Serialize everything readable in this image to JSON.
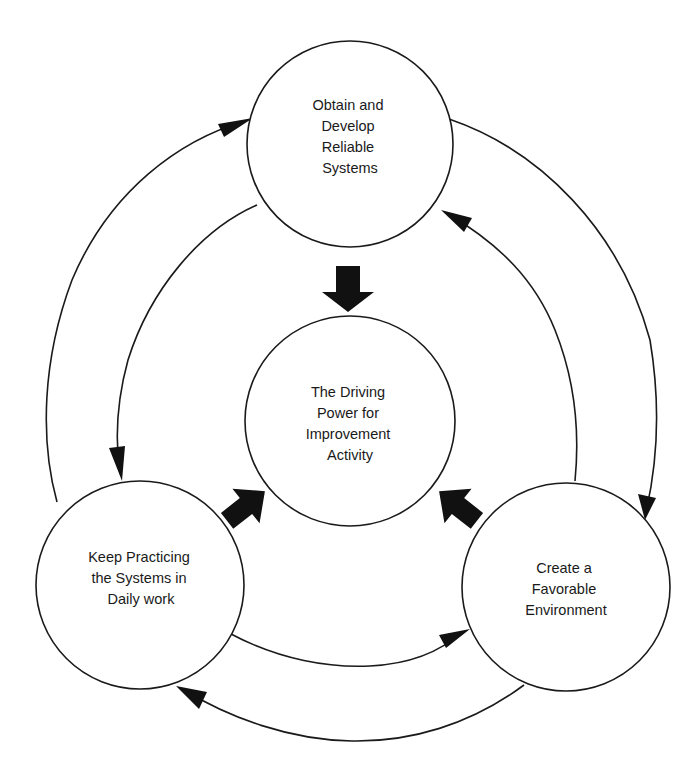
{
  "diagram": {
    "type": "cycle",
    "nodes": [
      {
        "id": "top",
        "lines": [
          "Obtain and",
          "Develop",
          "Reliable",
          "Systems"
        ]
      },
      {
        "id": "center",
        "lines": [
          "The Driving",
          "Power for",
          "Improvement",
          "Activity"
        ]
      },
      {
        "id": "left",
        "lines": [
          "Keep Practicing",
          "the Systems in",
          "Daily work"
        ]
      },
      {
        "id": "right",
        "lines": [
          "Create a",
          "Favorable",
          "Environment"
        ]
      }
    ],
    "edges": [
      {
        "from": "top",
        "to": "center",
        "style": "block-arrow"
      },
      {
        "from": "left",
        "to": "center",
        "style": "block-arrow"
      },
      {
        "from": "right",
        "to": "center",
        "style": "block-arrow"
      },
      {
        "from": "top",
        "to": "right",
        "style": "outer-arc"
      },
      {
        "from": "right",
        "to": "left",
        "style": "outer-arc"
      },
      {
        "from": "left",
        "to": "top",
        "style": "outer-arc"
      },
      {
        "from": "top",
        "to": "left",
        "style": "inner-arc"
      },
      {
        "from": "left",
        "to": "right",
        "style": "inner-arc"
      },
      {
        "from": "right",
        "to": "top",
        "style": "inner-arc"
      }
    ],
    "colors": {
      "line": "#1a1a1a",
      "fill": "#ffffff",
      "arrow": "#111111"
    }
  }
}
